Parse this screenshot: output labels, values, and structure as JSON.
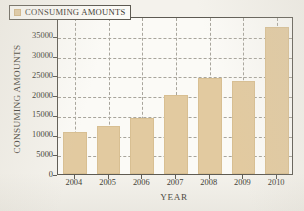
{
  "chart_data": {
    "type": "bar",
    "title": "",
    "xlabel": "YEAR",
    "ylabel": "CONSUMING AMOUNTS",
    "categories": [
      "2004",
      "2005",
      "2006",
      "2007",
      "2008",
      "2009",
      "2010"
    ],
    "values": [
      10600,
      12100,
      14200,
      20000,
      24300,
      23500,
      37300
    ],
    "series": [
      {
        "name": "CONSUMING AMOUNTS",
        "values": [
          10600,
          12100,
          14200,
          20000,
          24300,
          23500,
          37300
        ],
        "color": "#e2caa0"
      }
    ],
    "ylim": [
      0,
      40000
    ],
    "yticks": [
      0,
      5000,
      10000,
      15000,
      20000,
      25000,
      30000,
      35000,
      40000
    ],
    "ytick_labels": [
      "0",
      "5000",
      "10000",
      "15000",
      "20000",
      "25000",
      "30000",
      "35000",
      "40000"
    ],
    "xtick_labels": [
      "2004",
      "2005",
      "2006",
      "2007",
      "2008",
      "2009",
      "2010"
    ],
    "grid": true,
    "grid_style": "dashed",
    "grid_color": "#a8a59c",
    "legend": {
      "position": "upper-left-inside",
      "entries": [
        {
          "label": "CONSUMING AMOUNTS",
          "color": "#e2caa0"
        }
      ]
    },
    "axis_color": "#5d5a52",
    "plot_background": "#fbfaf6",
    "figure_background": "#f4f2ec"
  }
}
